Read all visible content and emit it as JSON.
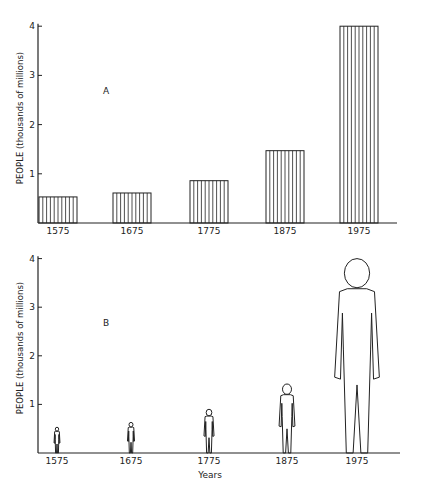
{
  "chart_data": [
    {
      "panel": "A",
      "type": "bar",
      "title": "",
      "panel_label": "A",
      "categories": [
        "1575",
        "1675",
        "1775",
        "1875",
        "1975"
      ],
      "values": [
        0.53,
        0.61,
        0.86,
        1.47,
        4.0
      ],
      "xlabel": "",
      "ylabel": "PEOPLE (thousands of millions)",
      "yticks": [
        "1",
        "2",
        "3",
        "4"
      ],
      "ylim": [
        0,
        4.1
      ],
      "fill": "vertical-hatch",
      "grid": false,
      "legend": null
    },
    {
      "panel": "B",
      "type": "pictogram",
      "title": "",
      "panel_label": "B",
      "categories": [
        "1575",
        "1675",
        "1775",
        "1875",
        "1975"
      ],
      "values": [
        0.53,
        0.63,
        0.9,
        1.42,
        4.0
      ],
      "xlabel": "Years",
      "ylabel": "PEOPLE (thousands of millions)",
      "yticks": [
        "1",
        "2",
        "3",
        "4"
      ],
      "ylim": [
        0,
        4.1
      ],
      "glyph": "human-figure-outline",
      "grid": false,
      "legend": null
    }
  ],
  "colors": {
    "ink": "#222222",
    "background": "#ffffff"
  }
}
